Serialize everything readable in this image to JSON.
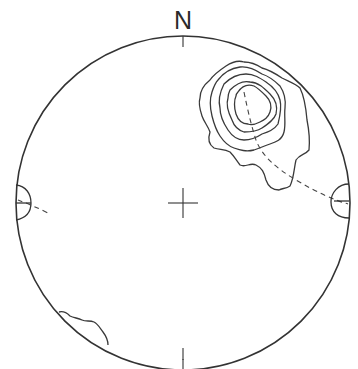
{
  "diagram": {
    "type": "stereonet",
    "north_label": "N",
    "colors": {
      "line": "#333333",
      "background": "#ffffff"
    },
    "primitive_circle": {
      "cx": 183,
      "cy": 203,
      "r": 167
    },
    "center_cross": {
      "x": 183,
      "y": 203,
      "size": 15
    },
    "cardinal_ticks": [
      "N",
      "S"
    ],
    "contour_cluster": {
      "location": "NE quadrant",
      "levels": 5
    },
    "edge_markers": [
      "W",
      "E"
    ],
    "dashed_trace": "great-circle trace from NE cluster to E edge, and short segment near W edge",
    "secondary_contour": "SW edge near primitive"
  }
}
